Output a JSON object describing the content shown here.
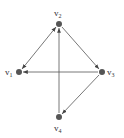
{
  "diagram": {
    "type": "directed-graph",
    "nodes": [
      {
        "id": "v1",
        "label": "v",
        "sub": "1",
        "x": 19,
        "y": 72
      },
      {
        "id": "v2",
        "label": "v",
        "sub": "2",
        "x": 59,
        "y": 24
      },
      {
        "id": "v3",
        "label": "v",
        "sub": "3",
        "x": 102,
        "y": 72
      },
      {
        "id": "v4",
        "label": "v",
        "sub": "4",
        "x": 59,
        "y": 117
      }
    ],
    "edges": [
      {
        "from": "v1",
        "to": "v2",
        "bidirectional": true
      },
      {
        "from": "v2",
        "to": "v3",
        "bidirectional": false
      },
      {
        "from": "v3",
        "to": "v1",
        "bidirectional": false
      },
      {
        "from": "v3",
        "to": "v4",
        "bidirectional": false
      },
      {
        "from": "v4",
        "to": "v2",
        "bidirectional": false
      }
    ],
    "colors": {
      "edge": "#555555",
      "node": "#555555",
      "label": "#333333"
    }
  }
}
